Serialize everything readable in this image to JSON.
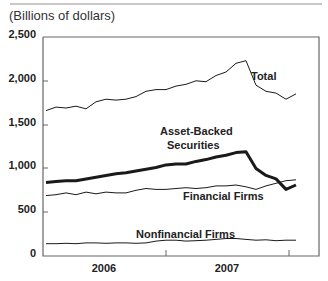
{
  "subtitle": "(Billions of dollars)",
  "y_ticks": [
    "2,500",
    "2,000",
    "1,500",
    "1,000",
    "500",
    "0"
  ],
  "x_ticks": [
    "2006",
    "2007"
  ],
  "labels": {
    "total": "Total",
    "abs_line1": "Asset-Backed",
    "abs_line2": "Securities",
    "financial": "Financial Firms",
    "nonfinancial": "Nonfinancial Firms"
  },
  "chart_data": {
    "type": "line",
    "title": "",
    "subtitle": "(Billions of dollars)",
    "xlabel": "",
    "ylabel": "Billions of dollars",
    "ylim": [
      0,
      2500
    ],
    "y_ticks": [
      0,
      500,
      1000,
      1500,
      2000,
      2500
    ],
    "x_tick_labels": [
      "2006",
      "2007"
    ],
    "grid": false,
    "legend": "inline labels",
    "x": [
      "2006-01",
      "2006-02",
      "2006-03",
      "2006-04",
      "2006-05",
      "2006-06",
      "2006-07",
      "2006-08",
      "2006-09",
      "2006-10",
      "2006-11",
      "2006-12",
      "2007-01",
      "2007-02",
      "2007-03",
      "2007-04",
      "2007-05",
      "2007-06",
      "2007-07",
      "2007-08",
      "2007-09",
      "2007-10",
      "2007-11",
      "2007-12",
      "2008-01",
      "2008-02"
    ],
    "series": [
      {
        "name": "Total",
        "values": [
          1660,
          1700,
          1690,
          1710,
          1680,
          1760,
          1790,
          1780,
          1790,
          1820,
          1880,
          1900,
          1900,
          1940,
          1960,
          2000,
          1990,
          2060,
          2100,
          2200,
          2230,
          1950,
          1880,
          1860,
          1790,
          1850
        ]
      },
      {
        "name": "Asset-Backed Securities",
        "values": [
          840,
          850,
          860,
          860,
          880,
          900,
          920,
          940,
          950,
          970,
          990,
          1010,
          1040,
          1050,
          1050,
          1080,
          1100,
          1130,
          1150,
          1180,
          1190,
          1000,
          920,
          880,
          760,
          810
        ]
      },
      {
        "name": "Financial Firms",
        "values": [
          690,
          700,
          720,
          700,
          730,
          710,
          730,
          720,
          720,
          750,
          770,
          760,
          760,
          770,
          780,
          770,
          780,
          800,
          800,
          810,
          790,
          760,
          800,
          830,
          860,
          870
        ]
      },
      {
        "name": "Nonfinancial Firms",
        "values": [
          140,
          140,
          145,
          140,
          150,
          150,
          145,
          150,
          150,
          145,
          150,
          170,
          180,
          180,
          170,
          175,
          180,
          190,
          200,
          200,
          190,
          180,
          185,
          175,
          180,
          180
        ]
      }
    ]
  }
}
